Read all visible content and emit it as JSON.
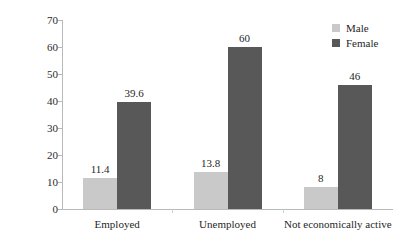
{
  "chart_data": {
    "type": "bar",
    "title": "",
    "xlabel": "",
    "ylabel": "Minutes",
    "ylim": [
      0,
      70
    ],
    "yticks": [
      0,
      10,
      20,
      30,
      40,
      50,
      60,
      70
    ],
    "grid": false,
    "legend_position": "top-right",
    "categories": [
      "Employed",
      "Unemployed",
      "Not economically active"
    ],
    "series": [
      {
        "name": "Male",
        "color": "#c9c9c9",
        "values": [
          11.4,
          13.8,
          8
        ]
      },
      {
        "name": "Female",
        "color": "#585858",
        "values": [
          39.6,
          60,
          46
        ]
      }
    ],
    "value_labels": [
      [
        "11.4",
        "39.6"
      ],
      [
        "13.8",
        "60"
      ],
      [
        "8",
        "46"
      ]
    ],
    "ytick_labels": [
      "0",
      "10",
      "20",
      "30",
      "40",
      "50",
      "60",
      "70"
    ]
  },
  "legend": {
    "items": [
      {
        "label": "Male",
        "swatch": "legend-swatch-male"
      },
      {
        "label": "Female",
        "swatch": "legend-swatch-female"
      }
    ]
  },
  "axis": {
    "y_title": "Minutes"
  }
}
